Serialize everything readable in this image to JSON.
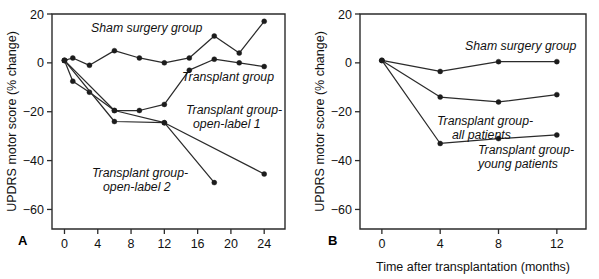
{
  "figure": {
    "panels": [
      {
        "id": "A",
        "label": "A",
        "ylabel": "UPDRS motor score (% change)",
        "xlabel": "",
        "yticks": [
          "20",
          "0",
          "−20",
          "−40",
          "−60"
        ],
        "xticks": [
          "0",
          "4",
          "8",
          "12",
          "16",
          "20",
          "24"
        ],
        "annotations": [
          {
            "name": "sham-surgery-group",
            "text": "Sham surgery group"
          },
          {
            "name": "transplant-group",
            "text": "Transplant group"
          },
          {
            "name": "transplant-group-open-label-1-line1",
            "text": "Transplant group-"
          },
          {
            "name": "transplant-group-open-label-1-line2",
            "text": "open-label 1"
          },
          {
            "name": "transplant-group-open-label-2-line1",
            "text": "Transplant group-"
          },
          {
            "name": "transplant-group-open-label-2-line2",
            "text": "open-label 2"
          }
        ]
      },
      {
        "id": "B",
        "label": "B",
        "ylabel": "UPDRS motor score (% change)",
        "xlabel": "Time after transplantation (months)",
        "yticks": [
          "20",
          "0",
          "−20",
          "−40",
          "−60"
        ],
        "xticks": [
          "0",
          "4",
          "8",
          "12"
        ],
        "annotations": [
          {
            "name": "sham-surgery-group",
            "text": "Sham surgery group"
          },
          {
            "name": "transplant-group-all-patients-line1",
            "text": "Transplant group-"
          },
          {
            "name": "transplant-group-all-patients-line2",
            "text": "all patients"
          },
          {
            "name": "transplant-group-young-patients-line1",
            "text": "Transplant group-"
          },
          {
            "name": "transplant-group-young-patients-line2",
            "text": "young patients"
          }
        ]
      }
    ]
  },
  "chart_data": [
    {
      "type": "line",
      "panel": "A",
      "title": "",
      "xlabel": "",
      "ylabel": "UPDRS motor score (% change)",
      "xlim": [
        -1.5,
        26.5
      ],
      "ylim": [
        -68,
        20
      ],
      "xticks": [
        0,
        4,
        8,
        12,
        16,
        20,
        24
      ],
      "yticks": [
        20,
        0,
        -20,
        -40,
        -60
      ],
      "grid": false,
      "legend": "inline-annotations",
      "markers": "filled-circle",
      "series": [
        {
          "name": "Sham surgery group",
          "x": [
            0,
            1,
            3,
            6,
            9,
            12,
            15,
            18,
            21,
            24
          ],
          "y": [
            1,
            2,
            -1,
            5,
            2,
            0,
            2,
            11,
            4,
            17
          ]
        },
        {
          "name": "Transplant group",
          "x": [
            0,
            1,
            3,
            6,
            9,
            12,
            15,
            18,
            21,
            24
          ],
          "y": [
            1,
            -7.5,
            -12,
            -19.5,
            -19.5,
            -17,
            -3,
            1.5,
            0,
            -1.5
          ]
        },
        {
          "name": "Transplant group-open-label 1",
          "x": [
            0,
            6,
            12,
            24
          ],
          "y": [
            1,
            -19.5,
            -24.5,
            -45.5
          ]
        },
        {
          "name": "Transplant group-open-label 2",
          "x": [
            0,
            6,
            12,
            18
          ],
          "y": [
            1,
            -24,
            -24.5,
            -49
          ]
        }
      ]
    },
    {
      "type": "line",
      "panel": "B",
      "title": "",
      "xlabel": "Time after transplantation (months)",
      "ylabel": "UPDRS motor score (% change)",
      "xlim": [
        -1.5,
        14
      ],
      "ylim": [
        -68,
        20
      ],
      "xticks": [
        0,
        4,
        8,
        12
      ],
      "yticks": [
        20,
        0,
        -20,
        -40,
        -60
      ],
      "grid": false,
      "legend": "inline-annotations",
      "markers": "filled-circle",
      "series": [
        {
          "name": "Sham surgery group",
          "x": [
            0,
            4,
            8,
            12
          ],
          "y": [
            1,
            -3.5,
            0.5,
            0.5
          ]
        },
        {
          "name": "Transplant group-all patients",
          "x": [
            0,
            4,
            8,
            12
          ],
          "y": [
            1,
            -14,
            -16,
            -13
          ]
        },
        {
          "name": "Transplant group-young patients",
          "x": [
            0,
            4,
            8,
            12
          ],
          "y": [
            1,
            -33,
            -31,
            -29.5
          ]
        }
      ]
    }
  ]
}
